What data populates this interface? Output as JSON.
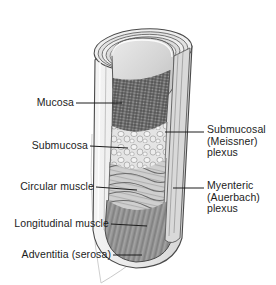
{
  "figure": {
    "background_color": "#ffffff",
    "width": 276,
    "height": 285
  },
  "palette": {
    "outline": "#3a3a3a",
    "leader_line": "#1c1c1c",
    "label_text": "#1c1c1c",
    "serosa_fill": "#e9e9e9",
    "adventitia_thin_line": "#c9c9c9",
    "longitudinal_muscle": "#8f8f8f",
    "circular_muscle": "#cfcfcf",
    "submucosa_fill": "#e2e2e2",
    "mucosa_fill": "#9a9a9a",
    "lumen_fill": "#d5d5d5",
    "rim_highlight": "#f2f2f2"
  },
  "labels": {
    "left": [
      {
        "id": "mucosa",
        "text": "Mucosa",
        "x": 38,
        "y": 97,
        "leader": {
          "x1": 76,
          "y1": 103,
          "x2": 122,
          "y2": 103
        }
      },
      {
        "id": "submucosa",
        "text": "Submucosa",
        "x": 24,
        "y": 140,
        "leader": {
          "x1": 90,
          "y1": 146,
          "x2": 128,
          "y2": 148
        }
      },
      {
        "id": "circular-muscle",
        "text": "Circular muscle",
        "x": 15,
        "y": 181,
        "leader": {
          "x1": 96,
          "y1": 187,
          "x2": 137,
          "y2": 190
        }
      },
      {
        "id": "longitudinal-muscle",
        "text": "Longitudinal muscle",
        "x": 6,
        "y": 218,
        "leader": {
          "x1": 111,
          "y1": 224,
          "x2": 147,
          "y2": 226
        }
      },
      {
        "id": "adventitia-serosa",
        "text": "Adventitia (serosa)",
        "x": 13,
        "y": 249,
        "leader": {
          "x1": 113,
          "y1": 255,
          "x2": 142,
          "y2": 255
        }
      }
    ],
    "right": [
      {
        "id": "submucosal-meissner-plexus",
        "lines": [
          "Submucosal",
          "(Meissner)",
          "plexus"
        ],
        "x": 207,
        "y": 124,
        "leader": {
          "x1": 165,
          "y1": 132,
          "x2": 204,
          "y2": 132
        }
      },
      {
        "id": "myenteric-auerbach-plexus",
        "lines": [
          "Myenteric",
          "(Auerbach)",
          "plexus"
        ],
        "x": 207,
        "y": 180,
        "leader": {
          "x1": 173,
          "y1": 188,
          "x2": 204,
          "y2": 188
        }
      }
    ]
  },
  "diagram_structure": {
    "view": "cut-away cylindrical segment of gut wall, tilted",
    "layers_outer_to_inner": [
      "Adventitia (serosa)",
      "Longitudinal muscle",
      "Myenteric (Auerbach) plexus",
      "Circular muscle",
      "Submucosal (Meissner) plexus",
      "Submucosa",
      "Mucosa"
    ],
    "textures": {
      "mucosa": "fine dark crosshatch mesh",
      "submucosa": "light irregular cellular outlines",
      "circular_muscle": "wavy horizontal fiber bands",
      "longitudinal_muscle": "vertical striations",
      "lumen": "smooth light gray cavity"
    }
  }
}
